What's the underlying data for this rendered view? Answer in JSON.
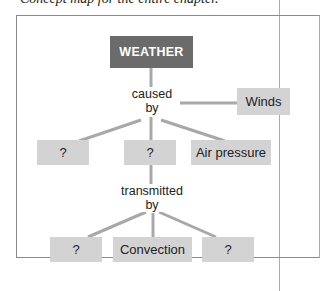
{
  "header": {
    "caption_fragment": "Concept map for the entire chapter."
  },
  "diagram": {
    "root": "WEATHER",
    "link_caused": [
      "caused",
      "by"
    ],
    "link_transmitted": [
      "transmitted",
      "by"
    ],
    "nodes": {
      "winds": "Winds",
      "cause_1": "?",
      "cause_2": "?",
      "air_pressure": "Air pressure",
      "trans_1": "?",
      "convection": "Convection",
      "trans_3": "?"
    },
    "colors": {
      "root_fill": "#6b6b6b",
      "node_fill": "#d3d3d3",
      "line": "#a8a8a8"
    }
  }
}
